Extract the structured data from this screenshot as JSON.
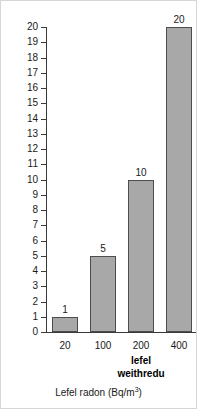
{
  "chart_data": {
    "type": "bar",
    "title": "",
    "categories": [
      "20",
      "100",
      "200",
      "400"
    ],
    "values": [
      1,
      5,
      10,
      20
    ],
    "value_labels": [
      "1",
      "5",
      "10",
      "20"
    ],
    "xlabel_text": "Lefel radon (Bq/m",
    "xlabel_sup": "3",
    "xlabel_tail": ")",
    "ylabel": "Nifer y bobl (ym mhob 1000)",
    "ylim": [
      0,
      20
    ],
    "ytick_step": 1,
    "yticks": [
      "0",
      "1",
      "2",
      "3",
      "4",
      "5",
      "6",
      "7",
      "8",
      "9",
      "10",
      "11",
      "12",
      "13",
      "14",
      "15",
      "16",
      "17",
      "18",
      "19",
      "20"
    ],
    "grid": false,
    "legend": null,
    "annotations": [
      {
        "name": "action-level",
        "line1": "lefel",
        "line2": "weithredu",
        "at_category": "200",
        "bold": true
      }
    ],
    "bar_fill": "#a8a8a8",
    "bar_edge": "#4d4d4d",
    "axis_color": "#3a3a3a",
    "background": "#ffffff",
    "frame_color": "#d6d6d6"
  }
}
